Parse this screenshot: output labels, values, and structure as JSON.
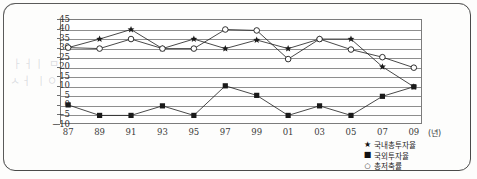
{
  "page": {
    "ghost_text_1": "ㅏㅓㅣ ㅁㅅㅇ ㅇㅣㅁ",
    "ghost_text_2": "ㅅㅓ ㅣㅇㅁ ㅡㅅ ㅣㅇ"
  },
  "chart_data": {
    "type": "line",
    "title": "",
    "subtitle": "",
    "xlabel": "(년)",
    "ylabel": "",
    "categories": [
      "87",
      "89",
      "91",
      "93",
      "95",
      "97",
      "99",
      "01",
      "03",
      "05",
      "07",
      "09"
    ],
    "ylim": [
      -10,
      45
    ],
    "ytick_labels": [
      "45",
      "40",
      "35",
      "30",
      "25",
      "20",
      "15",
      "10",
      "5",
      "0",
      "−5",
      "−10"
    ],
    "ytick_values": [
      45,
      40,
      35,
      30,
      25,
      20,
      15,
      10,
      5,
      0,
      -5,
      -10
    ],
    "grid": true,
    "legend_position": "bottom-right",
    "series": [
      {
        "name": "국내총투자율",
        "marker": "star-filled",
        "marker_glyph": "★",
        "color": "#1a1a1a",
        "values": [
          30,
          34.5,
          39.5,
          29.5,
          34.5,
          29.5,
          34,
          29.5,
          34.5,
          34.5,
          20,
          9.5
        ]
      },
      {
        "name": "국외투자율",
        "marker": "square-filled",
        "marker_glyph": "■",
        "color": "#1a1a1a",
        "values": [
          0,
          -5.5,
          -5.5,
          -0.5,
          -5.5,
          10,
          5,
          -5.5,
          -0.5,
          -5.5,
          4.5,
          9.5
        ]
      },
      {
        "name": "총저축률",
        "marker": "circle-hollow",
        "marker_glyph": "○",
        "color": "#1a1a1a",
        "values": [
          30,
          29.5,
          34.5,
          29.5,
          29.5,
          39.5,
          39,
          24,
          34.5,
          29,
          25,
          19.5
        ]
      }
    ]
  }
}
